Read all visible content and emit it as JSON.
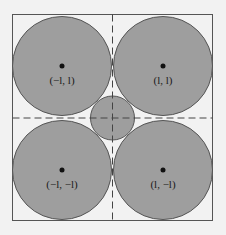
{
  "diagram": {
    "colors": {
      "background": "#f2f2f2",
      "fill": "#9e9e9e",
      "stroke": "#555555",
      "box": "#555555",
      "text": "#1a1a1a"
    },
    "circles": [
      {
        "id": "top-left",
        "label": "(−l, l)"
      },
      {
        "id": "top-right",
        "label": "(l, l)"
      },
      {
        "id": "bottom-left",
        "label": "(−l, −l)"
      },
      {
        "id": "bottom-right",
        "label": "(l, −l)"
      }
    ]
  }
}
